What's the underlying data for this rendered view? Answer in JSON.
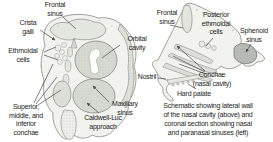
{
  "figure": {
    "type": "anatomical-schematic",
    "caption": "Schematic showing lateral wall\nof the nasal cavity (above) and\ncoronal section showing nasal\nand paranasal sinuses (left)"
  },
  "coronal_labels": {
    "frontal_sinus": "Frontal\nsinus",
    "crista_galli": "Crista\ngalli",
    "ethmoidal_cells": "Ethmoidal\ncells",
    "conchae": "Superior,\nmiddle, and\ninferior\nconchae",
    "orbital_cavity": "Orbital\ncavity",
    "maxillary_sinus": "Maxillary\nsinus",
    "caldwell_luc_approach": "Caldwell-Luc\napproach"
  },
  "sagittal_labels": {
    "frontal_sinus": "Frontal\nsinus",
    "posterior_ethmoidal_cells": "Posterior\nethmoidal\ncells",
    "sphenoid_sinus": "Sphenoid\nsinus",
    "nostril": "Nostril",
    "conchae": "Conchae\n(nasal cavity)",
    "hard_palate": "Hard palate"
  },
  "colors": {
    "outline": "#8a8a85",
    "leader_line": "#4a4a4a",
    "fill_light": "#f2f3ef",
    "fill_shaded": "#d7dad2",
    "fill_sinus": "#e4e6e0",
    "fill_sphenoid": "#b8bcb6",
    "text": "#1c1c1c",
    "background": "#ffffff"
  }
}
